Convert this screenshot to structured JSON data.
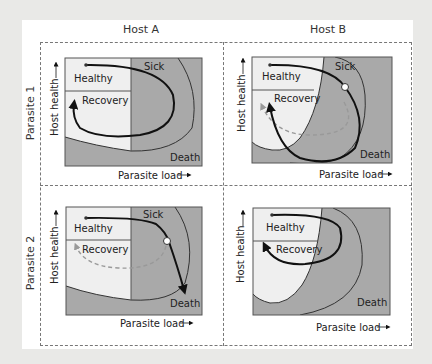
{
  "columns": [
    {
      "label": "Host A"
    },
    {
      "label": "Host B"
    }
  ],
  "rows": [
    {
      "label": "Parasite 1"
    },
    {
      "label": "Parasite 2"
    }
  ],
  "axes": {
    "y_label": "Host health",
    "x_label": "Parasite load",
    "arrow": "→",
    "up_arrow": "↑"
  },
  "regions": {
    "healthy": "Healthy",
    "recovery": "Recovery",
    "sick": "Sick",
    "death": "Death"
  },
  "colors": {
    "light_region": "#efefef",
    "dark_region": "#a9a9a9",
    "trajectory": "#111111",
    "alt_trajectory": "#999999"
  },
  "panels": [
    {
      "id": "host-a-parasite-1",
      "outcome": "recovery",
      "has_tipping_point": false,
      "has_alt_path": false
    },
    {
      "id": "host-b-parasite-1",
      "outcome": "recovery",
      "has_tipping_point": true,
      "has_alt_path": true
    },
    {
      "id": "host-a-parasite-2",
      "outcome": "death",
      "has_tipping_point": true,
      "has_alt_path": true
    },
    {
      "id": "host-b-parasite-2",
      "outcome": "recovery",
      "has_tipping_point": false,
      "has_alt_path": false
    }
  ]
}
